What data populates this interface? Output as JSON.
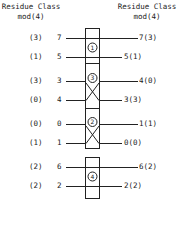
{
  "header": {
    "left": {
      "line1": "Residue Class",
      "line2": "mod(4)"
    },
    "right": {
      "line1": "Residue Class",
      "line2": "mod(4)"
    }
  },
  "stages": [
    {
      "id": "1",
      "type": "straight",
      "rows": [
        {
          "left_residue": "(3)",
          "left_value": "7",
          "right_label": "7(3)"
        },
        {
          "left_residue": "(1)",
          "left_value": "5",
          "right_label": "5(1)"
        }
      ]
    },
    {
      "id": "3",
      "type": "cross",
      "rows": [
        {
          "left_residue": "(3)",
          "left_value": "3",
          "right_label": "4(0)"
        },
        {
          "left_residue": "(0)",
          "left_value": "4",
          "right_label": "3(3)"
        }
      ]
    },
    {
      "id": "2",
      "type": "cross",
      "rows": [
        {
          "left_residue": "(0)",
          "left_value": "0",
          "right_label": "1(1)"
        },
        {
          "left_residue": "(1)",
          "left_value": "1",
          "right_label": "0(0)"
        }
      ]
    },
    {
      "id": "4",
      "type": "straight",
      "rows": [
        {
          "left_residue": "(2)",
          "left_value": "6",
          "right_label": "6(2)"
        },
        {
          "left_residue": "(2)",
          "left_value": "2",
          "right_label": "2(2)"
        }
      ]
    }
  ],
  "colors": {
    "line": "#222222",
    "background": "#ffffff"
  }
}
